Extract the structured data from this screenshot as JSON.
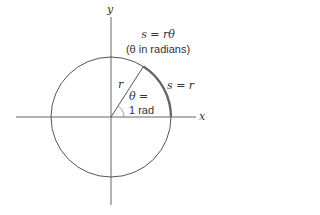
{
  "diagram": {
    "axes": {
      "x_label": "x",
      "y_label": "y"
    },
    "formula": {
      "line1": "s = rθ",
      "line2": "(θ in radians)"
    },
    "radius_label": "r",
    "arc_label": "s = r",
    "angle_label": {
      "line1": "θ =",
      "line2": "1 rad"
    },
    "geometry": {
      "center": [
        111,
        117
      ],
      "radius": 60,
      "angle_rad": 1
    },
    "colors": {
      "stroke": "#555555",
      "arc_highlight": "#666666",
      "text": "#333333"
    }
  }
}
